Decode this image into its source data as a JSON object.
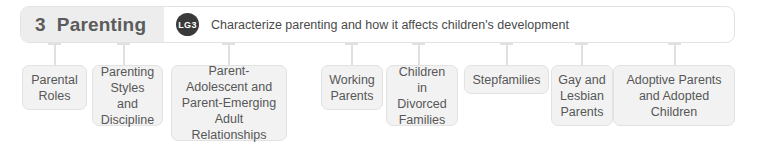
{
  "header": {
    "chapter_number": "3",
    "chapter_title": "Parenting",
    "badge_label": "LG3",
    "objective": "Characterize parenting and how it affects children's development",
    "pill_background": "#ffffff",
    "title_block_background": "#ededed",
    "badge_background": "#3a3a3a",
    "text_color": "#5b5b5b"
  },
  "connector": {
    "color": "#e0e0e0"
  },
  "topics": [
    {
      "label": "Parental Roles"
    },
    {
      "label": "Parenting Styles and Discipline"
    },
    {
      "label": "Parent-Adolescent and Parent-Emerging Adult Relationships"
    },
    {
      "label": "Working Parents"
    },
    {
      "label": "Children in Divorced Families"
    },
    {
      "label": "Stepfamilies"
    },
    {
      "label": "Gay and Lesbian Parents"
    },
    {
      "label": "Adoptive Parents and Adopted Children"
    }
  ],
  "style": {
    "box_background": "#f2f2f2",
    "box_border": "#e2e2e2",
    "box_text_color": "#575757"
  }
}
